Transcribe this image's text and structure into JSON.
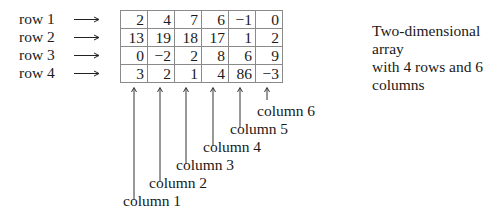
{
  "diagram": {
    "rows": [
      {
        "label": "row 1",
        "values": [
          "2",
          "4",
          "7",
          "6",
          "−1",
          "0"
        ]
      },
      {
        "label": "row 2",
        "values": [
          "13",
          "19",
          "18",
          "17",
          "1",
          "2"
        ]
      },
      {
        "label": "row 3",
        "values": [
          "0",
          "−2",
          "2",
          "8",
          "6",
          "9"
        ]
      },
      {
        "label": "row 4",
        "values": [
          "3",
          "2",
          "1",
          "4",
          "86",
          "−3"
        ]
      }
    ],
    "columns": [
      "column 1",
      "column 2",
      "column 3",
      "column 4",
      "column 5",
      "column 6"
    ],
    "description": {
      "line1": "Two-dimensional array",
      "line2": "with 4 rows and 6 columns"
    }
  }
}
